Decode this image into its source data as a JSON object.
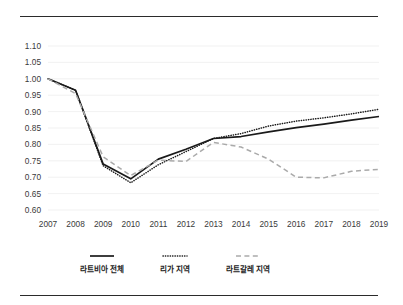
{
  "chart_data": {
    "type": "line",
    "title": "",
    "subtitle": "",
    "xlabel": "",
    "ylabel": "",
    "grid": true,
    "legend_position": "bottom",
    "x": [
      2007,
      2008,
      2009,
      2010,
      2011,
      2012,
      2013,
      2014,
      2015,
      2016,
      2017,
      2018,
      2019
    ],
    "categories": [
      "2007",
      "2008",
      "2009",
      "2010",
      "2011",
      "2012",
      "2013",
      "2014",
      "2015",
      "2016",
      "2017",
      "2018",
      "2019"
    ],
    "xlim": [
      2007,
      2019
    ],
    "ylim": [
      0.6,
      1.1
    ],
    "ytick_labels": [
      "1.10",
      "1.05",
      "1.00",
      "0.95",
      "0.90",
      "0.85",
      "0.80",
      "0.75",
      "0.70",
      "0.65",
      "0.60"
    ],
    "ytick_values": [
      1.1,
      1.05,
      1.0,
      0.95,
      0.9,
      0.85,
      0.8,
      0.75,
      0.7,
      0.65,
      0.6
    ],
    "series": [
      {
        "name": "라트비아 전체",
        "style": "solid",
        "color": "#1a1a1a",
        "values": [
          1.0,
          0.965,
          0.74,
          0.695,
          0.755,
          0.785,
          0.818,
          0.824,
          0.838,
          0.851,
          0.862,
          0.874,
          0.885
        ]
      },
      {
        "name": "리가 지역",
        "style": "dotted",
        "color": "#1a1a1a",
        "values": [
          1.0,
          0.965,
          0.735,
          0.683,
          0.738,
          0.778,
          0.818,
          0.833,
          0.856,
          0.871,
          0.881,
          0.893,
          0.907
        ]
      },
      {
        "name": "라트갈레 지역",
        "style": "dashed",
        "color": "#aaaaaa",
        "values": [
          1.0,
          0.955,
          0.762,
          0.705,
          0.752,
          0.748,
          0.806,
          0.792,
          0.755,
          0.7,
          0.698,
          0.718,
          0.724
        ]
      }
    ]
  },
  "legend": {
    "items": [
      {
        "label": "라트비아 전체",
        "style": "solid"
      },
      {
        "label": "리가 지역",
        "style": "dotted"
      },
      {
        "label": "라트갈레 지역",
        "style": "dashed"
      }
    ]
  },
  "colors": {
    "rule": "#2b2b2b",
    "grid": "#ededed",
    "solid_series": "#1a1a1a",
    "dotted_series": "#1a1a1a",
    "dashed_series": "#aaaaaa",
    "tick_text": "#3a3a3a"
  }
}
